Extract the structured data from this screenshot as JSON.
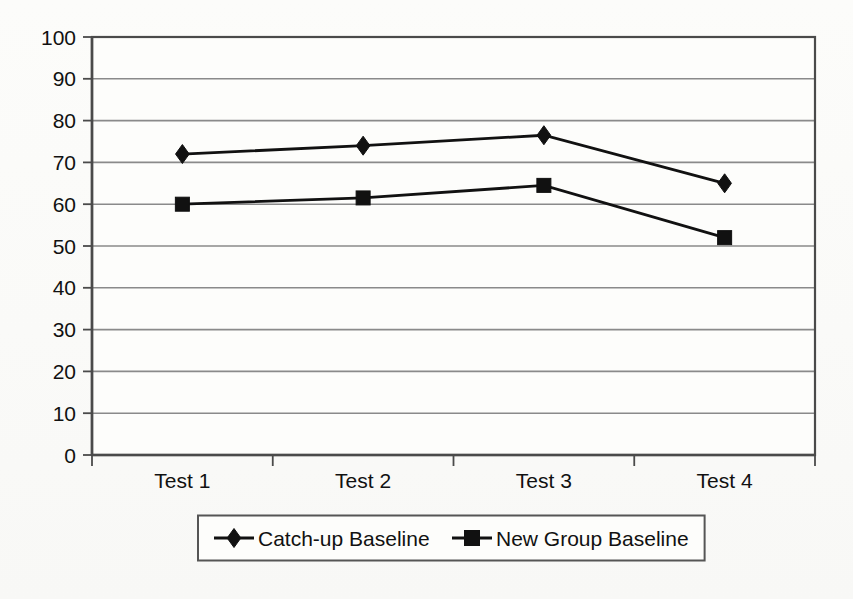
{
  "chart_data": {
    "type": "line",
    "title": "",
    "subtitle": "",
    "xlabel": "",
    "ylabel": "",
    "categories": [
      "Test 1",
      "Test 2",
      "Test 3",
      "Test 4"
    ],
    "series": [
      {
        "name": "Catch-up Baseline",
        "marker": "diamond",
        "color": "#111111",
        "values": [
          72,
          74,
          76.5,
          65
        ]
      },
      {
        "name": "New Group Baseline",
        "marker": "square",
        "color": "#111111",
        "values": [
          60,
          61.5,
          64.5,
          52
        ]
      }
    ],
    "ylim": [
      0,
      100
    ],
    "y_ticks": [
      0,
      10,
      20,
      30,
      40,
      50,
      60,
      70,
      80,
      90,
      100
    ],
    "y_tick_labels": [
      "0",
      "10",
      "20",
      "30",
      "40",
      "50",
      "60",
      "70",
      "80",
      "90",
      "100"
    ],
    "grid": true,
    "grid_axis": "y",
    "grid_color": "#8a8a8a",
    "legend_position": "bottom",
    "legend_border": true,
    "plot_border": true,
    "plot_border_color": "#4a4a4a",
    "background_color": "#fbfbf9",
    "axis_color": "#4a4a4a"
  },
  "legend": {
    "entries": [
      {
        "label": "Catch-up Baseline",
        "marker": "diamond-marker"
      },
      {
        "label": "New Group Baseline",
        "marker": "square-marker"
      }
    ]
  }
}
